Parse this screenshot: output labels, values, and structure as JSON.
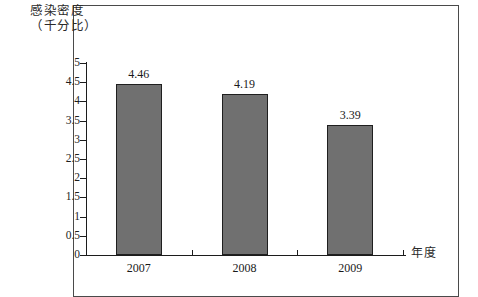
{
  "chart_data": {
    "type": "bar",
    "title": "感染密度",
    "subtitle": "（千分比）",
    "title_lines": [
      "感染密度",
      "（千分比）"
    ],
    "categories": [
      "2007",
      "2008",
      "2009"
    ],
    "values": [
      4.46,
      4.19,
      3.39
    ],
    "value_labels": [
      "4.46",
      "4.19",
      "3.39"
    ],
    "xlabel": "年度",
    "ylabel": "感染密度（千分比）",
    "ylim": [
      0,
      5
    ],
    "ytick_step": 0.5,
    "ytick_labels": [
      "5",
      "4.5",
      "4",
      "3.5",
      "3",
      "2.5",
      "2",
      "1.5",
      "1",
      "0.5",
      "0"
    ],
    "ytick_values": [
      5,
      4.5,
      4,
      3.5,
      3,
      2.5,
      2,
      1.5,
      1,
      0.5,
      0
    ],
    "grid": false,
    "legend": false,
    "legend_position": "none",
    "series": [
      {
        "name": "感染密度",
        "values": [
          4.46,
          4.19,
          3.39
        ]
      }
    ],
    "colors": {
      "bar_fill": "#707070",
      "bar_stroke": "#1f1f1f",
      "axis": "#1c1c1c",
      "text": "#1a1a1a",
      "frame": "#4a4a4a",
      "background": "#ffffff"
    }
  }
}
